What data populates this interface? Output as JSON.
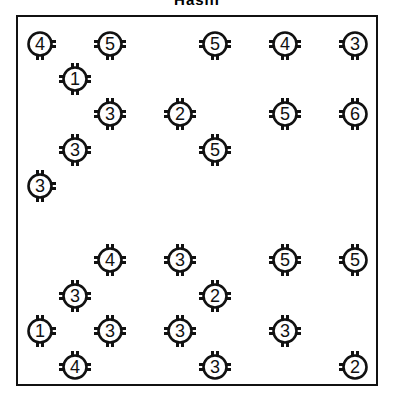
{
  "title": "Hashi",
  "board": {
    "columns": 10,
    "rows": 10,
    "origin_x": 40,
    "origin_y": 44,
    "spacing_x": 35,
    "spacing_y": 36,
    "line_color": "#111111"
  },
  "islands": [
    {
      "col": 0,
      "row": 0,
      "value": "4",
      "x": 40,
      "y": 44,
      "ticks": [
        "right",
        "bottom"
      ]
    },
    {
      "col": 2,
      "row": 0,
      "value": "5",
      "x": 110,
      "y": 44,
      "ticks": [
        "left",
        "right",
        "bottom"
      ]
    },
    {
      "col": 5,
      "row": 0,
      "value": "5",
      "x": 215,
      "y": 44,
      "ticks": [
        "left",
        "right",
        "bottom"
      ]
    },
    {
      "col": 7,
      "row": 0,
      "value": "4",
      "x": 285,
      "y": 44,
      "ticks": [
        "left",
        "right",
        "bottom"
      ]
    },
    {
      "col": 9,
      "row": 0,
      "value": "3",
      "x": 355,
      "y": 44,
      "ticks": [
        "left",
        "bottom"
      ]
    },
    {
      "col": 1,
      "row": 1,
      "value": "1",
      "x": 75,
      "y": 79,
      "ticks": [
        "top",
        "left",
        "right",
        "bottom"
      ]
    },
    {
      "col": 2,
      "row": 2,
      "value": "3",
      "x": 110,
      "y": 114,
      "ticks": [
        "top",
        "left",
        "right",
        "bottom"
      ]
    },
    {
      "col": 4,
      "row": 2,
      "value": "2",
      "x": 180,
      "y": 114,
      "ticks": [
        "top",
        "left",
        "right",
        "bottom"
      ]
    },
    {
      "col": 7,
      "row": 2,
      "value": "5",
      "x": 285,
      "y": 114,
      "ticks": [
        "top",
        "left",
        "right",
        "bottom"
      ]
    },
    {
      "col": 9,
      "row": 2,
      "value": "6",
      "x": 355,
      "y": 114,
      "ticks": [
        "top",
        "left",
        "bottom"
      ]
    },
    {
      "col": 1,
      "row": 3,
      "value": "3",
      "x": 75,
      "y": 150,
      "ticks": [
        "top",
        "left",
        "right",
        "bottom"
      ]
    },
    {
      "col": 5,
      "row": 3,
      "value": "5",
      "x": 215,
      "y": 150,
      "ticks": [
        "top",
        "left",
        "right",
        "bottom"
      ]
    },
    {
      "col": 0,
      "row": 4,
      "value": "3",
      "x": 40,
      "y": 186,
      "ticks": [
        "top",
        "right",
        "bottom"
      ]
    },
    {
      "col": 2,
      "row": 6,
      "value": "4",
      "x": 110,
      "y": 260,
      "ticks": [
        "top",
        "left",
        "right",
        "bottom"
      ]
    },
    {
      "col": 4,
      "row": 6,
      "value": "3",
      "x": 180,
      "y": 260,
      "ticks": [
        "top",
        "left",
        "right",
        "bottom"
      ]
    },
    {
      "col": 7,
      "row": 6,
      "value": "5",
      "x": 285,
      "y": 260,
      "ticks": [
        "top",
        "left",
        "right",
        "bottom"
      ]
    },
    {
      "col": 9,
      "row": 6,
      "value": "5",
      "x": 355,
      "y": 260,
      "ticks": [
        "top",
        "left",
        "bottom"
      ]
    },
    {
      "col": 1,
      "row": 7,
      "value": "3",
      "x": 75,
      "y": 296,
      "ticks": [
        "top",
        "left",
        "right",
        "bottom"
      ]
    },
    {
      "col": 5,
      "row": 7,
      "value": "2",
      "x": 215,
      "y": 296,
      "ticks": [
        "top",
        "left",
        "right",
        "bottom"
      ]
    },
    {
      "col": 0,
      "row": 8,
      "value": "1",
      "x": 40,
      "y": 331,
      "ticks": [
        "top",
        "right",
        "bottom"
      ]
    },
    {
      "col": 2,
      "row": 8,
      "value": "3",
      "x": 110,
      "y": 331,
      "ticks": [
        "top",
        "left",
        "right",
        "bottom"
      ]
    },
    {
      "col": 4,
      "row": 8,
      "value": "3",
      "x": 180,
      "y": 331,
      "ticks": [
        "top",
        "left",
        "right",
        "bottom"
      ]
    },
    {
      "col": 7,
      "row": 8,
      "value": "3",
      "x": 285,
      "y": 331,
      "ticks": [
        "top",
        "left",
        "right",
        "bottom"
      ]
    },
    {
      "col": 1,
      "row": 9,
      "value": "4",
      "x": 75,
      "y": 367,
      "ticks": [
        "top",
        "left",
        "right"
      ]
    },
    {
      "col": 5,
      "row": 9,
      "value": "3",
      "x": 215,
      "y": 367,
      "ticks": [
        "top",
        "left",
        "right"
      ]
    },
    {
      "col": 9,
      "row": 9,
      "value": "2",
      "x": 355,
      "y": 367,
      "ticks": [
        "top",
        "left"
      ]
    }
  ]
}
